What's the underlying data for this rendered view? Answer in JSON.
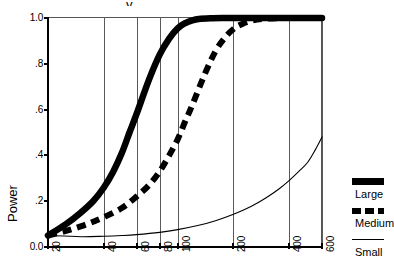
{
  "chart_data": {
    "type": "line",
    "title": "",
    "xlabel": "",
    "ylabel": "Power",
    "xscale": "log",
    "xlim": [
      20,
      600
    ],
    "ylim": [
      0.0,
      1.0
    ],
    "grid": "vertical",
    "legend_position": "right",
    "x_ticks": [
      20,
      40,
      60,
      80,
      100,
      200,
      400,
      600
    ],
    "x_tick_labels": [
      "20",
      "40",
      "60",
      "80",
      "100",
      "200",
      "400",
      "600"
    ],
    "y_ticks": [
      0.0,
      0.2,
      0.4,
      0.6,
      0.8,
      1.0
    ],
    "y_tick_labels": [
      "0.0",
      ".2",
      ".4",
      ".6",
      ".8",
      "1.0"
    ],
    "series": [
      {
        "name": "Large",
        "style": "thick-solid",
        "color": "#000000",
        "x": [
          20,
          25,
          30,
          35,
          40,
          45,
          50,
          55,
          60,
          70,
          80,
          90,
          100,
          110,
          120,
          130,
          150,
          175,
          200,
          250,
          300,
          400,
          500,
          600
        ],
        "values": [
          0.05,
          0.1,
          0.15,
          0.2,
          0.26,
          0.33,
          0.41,
          0.5,
          0.58,
          0.73,
          0.84,
          0.91,
          0.955,
          0.978,
          0.99,
          0.996,
          0.999,
          1.0,
          1.0,
          1.0,
          1.0,
          1.0,
          1.0,
          1.0
        ]
      },
      {
        "name": "Medium",
        "style": "thick-dashed",
        "color": "#000000",
        "x": [
          20,
          25,
          30,
          35,
          40,
          50,
          60,
          70,
          80,
          90,
          100,
          110,
          120,
          140,
          160,
          180,
          200,
          220,
          250,
          300,
          400,
          500,
          600
        ],
        "values": [
          0.05,
          0.07,
          0.09,
          0.11,
          0.13,
          0.17,
          0.22,
          0.27,
          0.33,
          0.4,
          0.47,
          0.55,
          0.62,
          0.755,
          0.855,
          0.915,
          0.952,
          0.972,
          0.988,
          0.997,
          1.0,
          1.0,
          1.0
        ]
      },
      {
        "name": "Small",
        "style": "thin-solid",
        "color": "#000000",
        "x": [
          20,
          30,
          40,
          50,
          60,
          80,
          100,
          130,
          160,
          200,
          250,
          300,
          350,
          400,
          450,
          500,
          550,
          600
        ],
        "values": [
          0.05,
          0.045,
          0.047,
          0.05,
          0.054,
          0.064,
          0.076,
          0.095,
          0.115,
          0.143,
          0.178,
          0.215,
          0.252,
          0.291,
          0.33,
          0.368,
          0.422,
          0.48
        ]
      }
    ]
  },
  "legend": {
    "items": [
      {
        "label": "Large",
        "swatch": "thick-solid-swatch"
      },
      {
        "label": "Medium",
        "swatch": "thick-dashed-swatch"
      },
      {
        "label": "Small",
        "swatch": "thin-solid-swatch"
      }
    ]
  },
  "axes": {
    "y_title": "Power"
  }
}
